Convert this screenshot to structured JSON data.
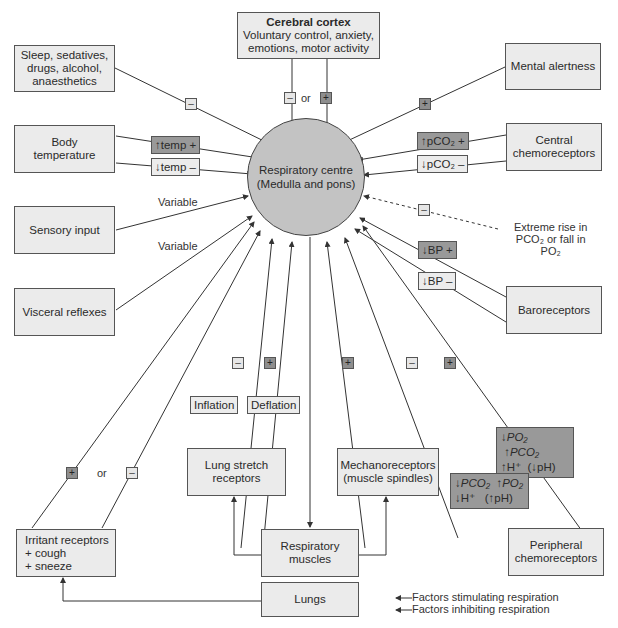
{
  "centre": {
    "label": "Respiratory centre\n(Medulla and pons)",
    "fill": "#c3c3c3"
  },
  "boxes": {
    "cortex_title": "Cerebral cortex",
    "cortex_body": "Voluntary control, anxiety,\nemotions, motor activity",
    "sleep": "Sleep, sedatives,\ndrugs, alcohol,\nanaesthetics",
    "mental": "Mental alertness",
    "body_temp": "Body\ntemperature",
    "central_chemo": "Central\nchemoreceptors",
    "sensory": "Sensory input",
    "visceral": "Visceral reflexes",
    "baro": "Baroreceptors",
    "lung_stretch": "Lung stretch\nreceptors",
    "mechano": "Mechanoreceptors\n(muscle spindles)",
    "irritant": "Irritant receptors\n+ cough\n+ sneeze",
    "resp_muscles": "Respiratory\nmuscles",
    "lungs": "Lungs",
    "peripheral": "Peripheral\nchemoreceptors"
  },
  "tags": {
    "temp_up": "temp +",
    "temp_down": "temp –",
    "pco2_up": "pCO₂ +",
    "pco2_down": "pCO₂ –",
    "bp_plus": "BP +",
    "bp_minus": "BP –",
    "inflation": "Inflation",
    "deflation": "Deflation"
  },
  "signs": {
    "plus": "+",
    "minus": "–"
  },
  "labels": {
    "or": "or",
    "variable": "Variable",
    "extreme": "Extreme rise in\nPCO₂ or fall in\nPO₂"
  },
  "chemo": {
    "stim_row1a": "PO₂",
    "stim_row1b": "PCO₂",
    "stim_row2a": "H⁺",
    "stim_row2b": "pH)",
    "inhib_row1a": "PCO₂",
    "inhib_row1b": "PO₂",
    "inhib_row2a": "H⁺",
    "inhib_row2b": "pH)"
  },
  "legend": {
    "stimulating": "Factors stimulating respiration",
    "inhibiting": "Factors inhibiting respiration"
  },
  "colors": {
    "box_fill": "#ebebeb",
    "plus_fill": "#8e8e8e",
    "minus_fill": "#e6e6e6",
    "chemo_fill": "#999999",
    "line": "#333333"
  }
}
